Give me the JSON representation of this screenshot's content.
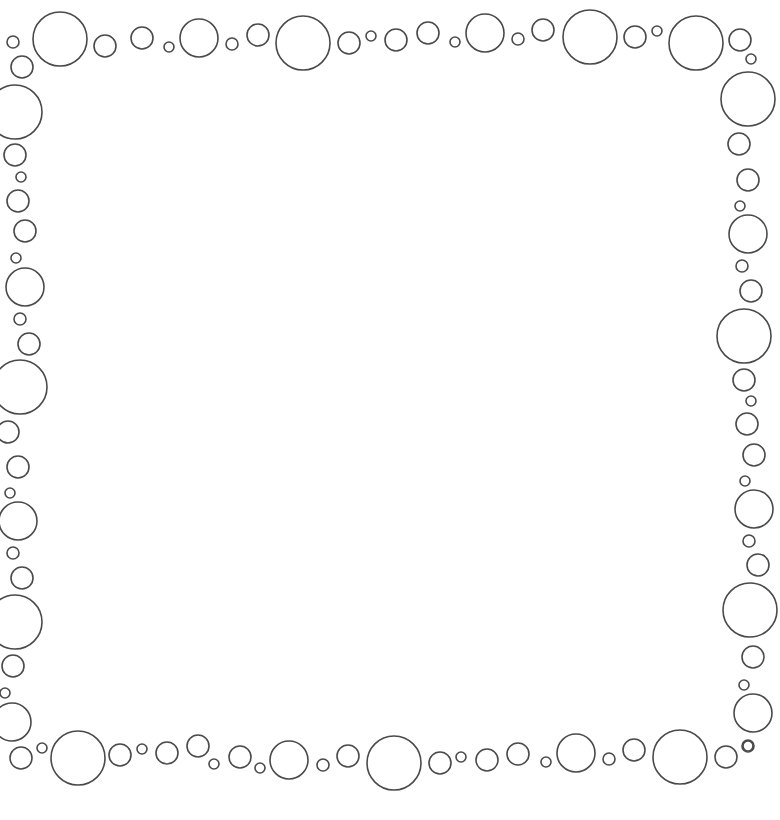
{
  "image": {
    "description": "Decorative bubble border frame on white background",
    "stroke_color": "#4a4a4a",
    "background_color": "#ffffff",
    "groups": [
      "top-border",
      "left-border",
      "right-border",
      "bottom-border"
    ]
  }
}
